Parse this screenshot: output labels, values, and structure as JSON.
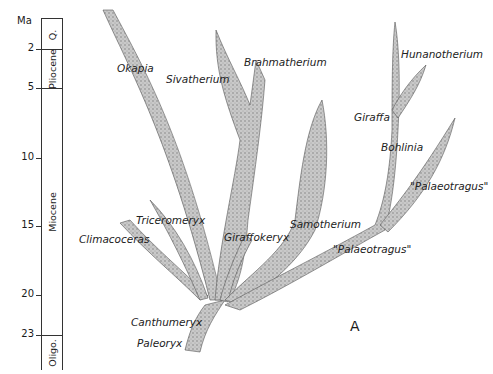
{
  "timescale": {
    "unit_label": "Ma",
    "ticks": [
      {
        "label": "2",
        "y": 49
      },
      {
        "label": "5",
        "y": 88
      },
      {
        "label": "10",
        "y": 158
      },
      {
        "label": "15",
        "y": 226
      },
      {
        "label": "20",
        "y": 295
      },
      {
        "label": "23",
        "y": 335
      }
    ],
    "epochs": [
      {
        "label": "Q.",
        "top": 18,
        "bottom": 49
      },
      {
        "label": "Pliocene",
        "top": 49,
        "bottom": 88
      },
      {
        "label": "Miocene",
        "top": 88,
        "bottom": 335
      },
      {
        "label": "Oligo.",
        "top": 335,
        "bottom": 370
      }
    ]
  },
  "taxa": {
    "okapia": "Okapia",
    "sivatherium": "Sivatherium",
    "brahmatherium": "Brahmatherium",
    "hunanotherium": "Hunanotherium",
    "giraffa": "Giraffa",
    "bohlinia": "Bohlinia",
    "palaeotragus_upper": "\"Palaeotragus\"",
    "palaeotragus_lower": "\"Palaeotragus\"",
    "samotherium": "Samotherium",
    "giraffokeryx": "Giraffokeryx",
    "triceromeryx": "Triceromeryx",
    "climacoceras": "Climacoceras",
    "canthumeryx": "Canthumeryx",
    "paleoryx": "Paleoryx"
  },
  "panel_letter": "A",
  "colors": {
    "branch_fill": "#bdbdbd",
    "branch_stroke": "#555555",
    "line": "#333333"
  }
}
